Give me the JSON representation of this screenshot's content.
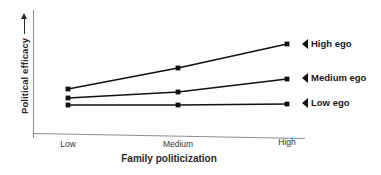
{
  "chart_data": {
    "type": "line",
    "title": "",
    "xlabel": "Family politicization",
    "ylabel": "Political efficacy",
    "ylabel_arrow": "up-arrow",
    "categories": [
      "Low",
      "Medium",
      "High"
    ],
    "grid": false,
    "legend_position": "right-inline-callout",
    "yaxis_ticks": [],
    "ylim": [
      0,
      100
    ],
    "series": [
      {
        "name": "High ego",
        "label": "High ego",
        "values": [
          44,
          66,
          90
        ],
        "points": [
          {
            "x": "Low",
            "px": 68,
            "py": 89
          },
          {
            "x": "Medium",
            "px": 178,
            "py": 68
          },
          {
            "x": "High",
            "px": 287,
            "py": 44
          }
        ],
        "color": "#111111"
      },
      {
        "name": "Medium ego",
        "label": "Medium ego",
        "values": [
          35,
          41,
          55
        ],
        "points": [
          {
            "x": "Low",
            "px": 68,
            "py": 98
          },
          {
            "x": "Medium",
            "px": 178,
            "py": 92
          },
          {
            "x": "High",
            "px": 287,
            "py": 79
          }
        ],
        "color": "#111111"
      },
      {
        "name": "Low ego",
        "label": "Low ego",
        "values": [
          28,
          28,
          29
        ],
        "points": [
          {
            "x": "Low",
            "px": 68,
            "py": 105
          },
          {
            "x": "Medium",
            "px": 178,
            "py": 105
          },
          {
            "x": "High",
            "px": 287,
            "py": 104
          }
        ],
        "color": "#111111"
      }
    ]
  },
  "axes": {
    "x_ticks": [
      {
        "label": "Low",
        "px": 68
      },
      {
        "label": "Medium",
        "px": 178
      },
      {
        "label": "High",
        "px": 287
      }
    ],
    "x_title": "Family politicization",
    "y_title": "Political efficacy"
  },
  "callouts": [
    {
      "label": "High ego",
      "left": 302,
      "top": 38,
      "marker": "left-triangle-marker"
    },
    {
      "label": "Medium ego",
      "left": 302,
      "top": 72,
      "marker": "left-triangle-marker"
    },
    {
      "label": "Low ego",
      "left": 302,
      "top": 97,
      "marker": "left-triangle-marker"
    }
  ],
  "colors": {
    "background": "#fdfdfd",
    "axis": "#8d8d8d",
    "series_line": "#111111",
    "text": "#1a1a1a"
  }
}
